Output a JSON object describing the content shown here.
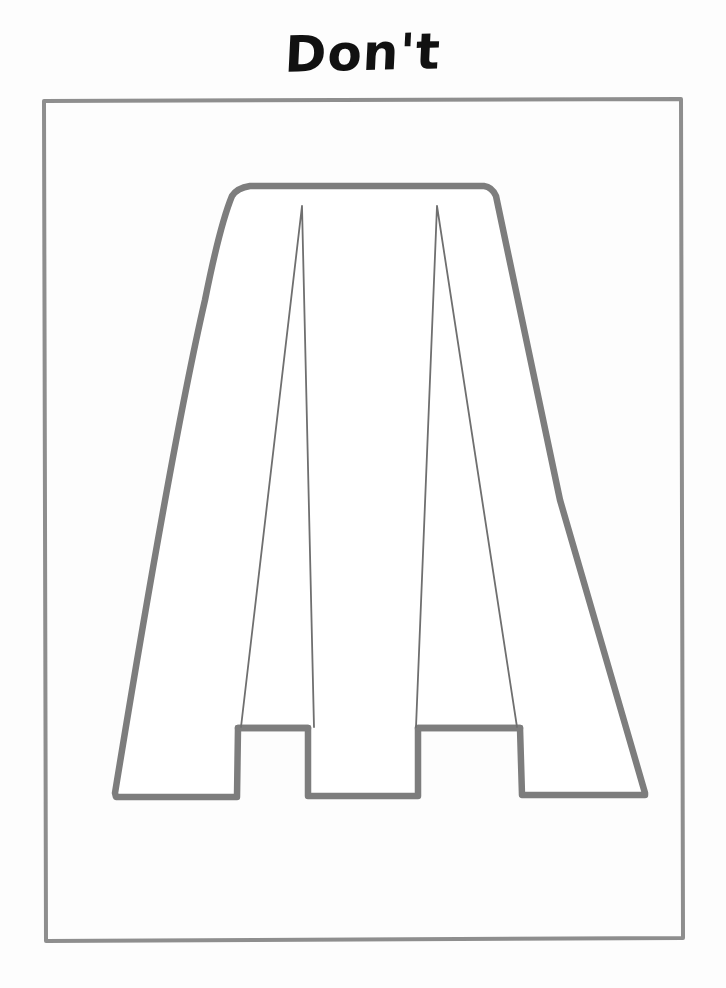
{
  "page": {
    "title": "Don't",
    "background_color": "#fdfdfd",
    "width": 726,
    "height": 988
  },
  "title": {
    "text": "Don't",
    "color": "#111111",
    "style": "handwritten-marker"
  },
  "frame": {
    "name": "illustration-border",
    "color": "#8e8e8e",
    "x": 42,
    "y": 100,
    "width": 641,
    "height": 840
  },
  "illustration": {
    "subject": "a-line-skirt-pattern",
    "caption": "Don't",
    "line_color": "#7d7d7d",
    "dart_color": "#6f6f6f",
    "fill_color": "#ffffff",
    "parts": [
      {
        "name": "waistband",
        "label": "Waistband"
      },
      {
        "name": "left-panel",
        "label": "Left panel"
      },
      {
        "name": "center-panel",
        "label": "Center panel"
      },
      {
        "name": "right-panel",
        "label": "Right panel"
      },
      {
        "name": "left-dart",
        "label": "Left dart"
      },
      {
        "name": "right-dart",
        "label": "Right dart"
      },
      {
        "name": "stepped-hem",
        "label": "Stepped hem"
      }
    ],
    "geometry": {
      "waist_left_x": 243,
      "waist_right_x": 490,
      "waist_y": 186,
      "hem_low_y": 797,
      "hem_step_y": 728,
      "left_hem_x": 115,
      "right_hem_x": 645,
      "left_dart_apex_x": 302,
      "right_dart_apex_x": 437,
      "dart_apex_y": 205
    }
  }
}
